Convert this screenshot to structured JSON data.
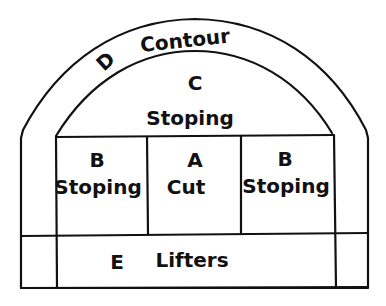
{
  "diagram": {
    "zones": {
      "A": {
        "letter": "A",
        "name": "Cut"
      },
      "B_left": {
        "letter": "B",
        "name": "Stoping"
      },
      "B_right": {
        "letter": "B",
        "name": "Stoping"
      },
      "C": {
        "letter": "C",
        "name": "Stoping"
      },
      "D": {
        "letter": "D",
        "name": "Contour"
      },
      "E": {
        "letter": "E",
        "name": "Lifters"
      }
    },
    "colors": {
      "line": "#111111",
      "background": "#ffffff"
    }
  }
}
